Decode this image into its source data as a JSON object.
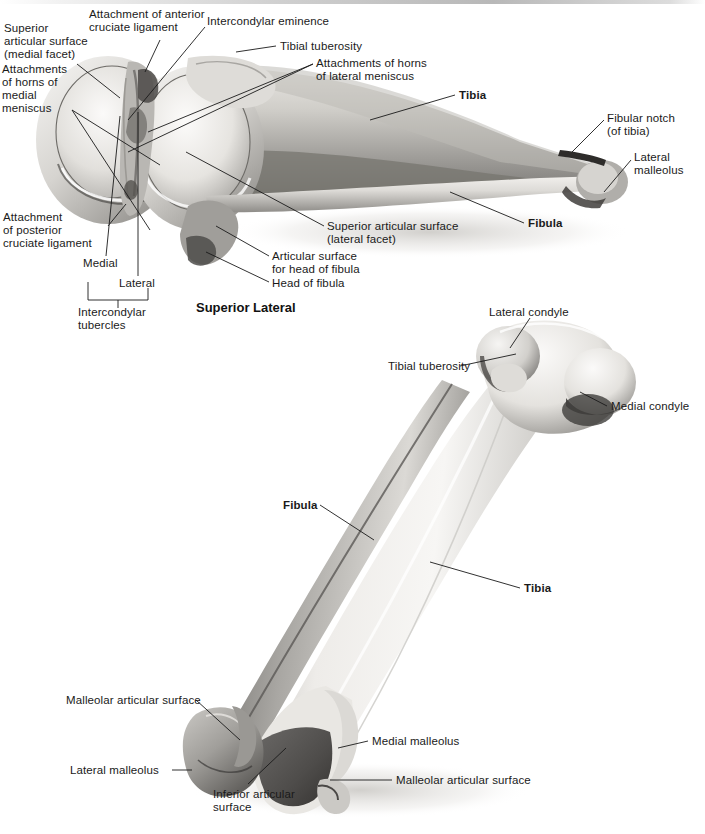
{
  "page": {
    "background_color": "#ffffff",
    "text_color": "#1a1a1a",
    "width": 705,
    "height": 834
  },
  "figures": [
    {
      "id": "figure-superior-lateral",
      "caption": "Superior Lateral",
      "labels": [
        {
          "id": "superior-articular-surface-medial-facet",
          "text": "Superior\narticular surface\n(medial facet)",
          "x": 4,
          "y": 27,
          "bold": false
        },
        {
          "id": "attachment-of-anterior-cruciate-ligament",
          "text": "Attachment of anterior\ncruciate ligament",
          "x": 89,
          "y": 10,
          "bold": false
        },
        {
          "id": "intercondylar-eminence",
          "text": "Intercondylar eminence",
          "x": 207,
          "y": 17,
          "bold": false
        },
        {
          "id": "attachments-of-horns-of-medial-meniscus",
          "text": "Attachments\nof horns of\nmedial\nmeniscus",
          "x": 2,
          "y": 68,
          "bold": false
        },
        {
          "id": "tibial-tuberosity-top",
          "text": "Tibial tuberosity",
          "x": 279,
          "y": 39,
          "bold": false
        },
        {
          "id": "attachments-of-horns-of-lateral-meniscus",
          "text": "Attachments of horns\nof lateral meniscus",
          "x": 315,
          "y": 57,
          "bold": false
        },
        {
          "id": "tibia-top",
          "text": "Tibia",
          "x": 459,
          "y": 88,
          "bold": true
        },
        {
          "id": "fibular-notch-of-tibia",
          "text": "Fibular notch\n(of tibia)",
          "x": 606,
          "y": 111,
          "bold": false
        },
        {
          "id": "lateral-malleolus-top",
          "text": "Lateral\nmalleolus",
          "x": 633,
          "y": 150,
          "bold": false
        },
        {
          "id": "fibula-top",
          "text": "Fibula",
          "x": 527,
          "y": 217,
          "bold": true
        },
        {
          "id": "superior-articular-surface-lateral-facet",
          "text": "Superior articular surface\n(lateral facet)",
          "x": 326,
          "y": 219,
          "bold": false
        },
        {
          "id": "articular-surface-for-head-of-fibula",
          "text": "Articular surface\nfor head of fibula",
          "x": 271,
          "y": 250,
          "bold": false
        },
        {
          "id": "head-of-fibula",
          "text": "Head of fibula",
          "x": 271,
          "y": 277,
          "bold": false
        },
        {
          "id": "attachment-of-posterior-cruciate-ligament",
          "text": "Attachment\nof posterior\ncruciate ligament",
          "x": 3,
          "y": 215,
          "bold": false
        },
        {
          "id": "medial-tubercle",
          "text": "Medial",
          "x": 83,
          "y": 262,
          "bold": false
        },
        {
          "id": "lateral-tubercle",
          "text": "Lateral",
          "x": 119,
          "y": 281,
          "bold": false
        },
        {
          "id": "intercondylar-tubercles",
          "text": "Intercondylar\ntubercles",
          "x": 78,
          "y": 304,
          "bold": false
        }
      ]
    },
    {
      "id": "figure-anterior",
      "caption": "",
      "labels": [
        {
          "id": "lateral-condyle",
          "text": "Lateral condyle",
          "x": 488,
          "y": 305,
          "bold": false
        },
        {
          "id": "tibial-tuberosity-bottom",
          "text": "Tibial tuberosity",
          "x": 388,
          "y": 360,
          "bold": false
        },
        {
          "id": "medial-condyle",
          "text": "Medial condyle",
          "x": 610,
          "y": 400,
          "bold": false
        },
        {
          "id": "fibula-bottom",
          "text": "Fibula",
          "x": 283,
          "y": 500,
          "bold": true
        },
        {
          "id": "tibia-bottom",
          "text": "Tibia",
          "x": 523,
          "y": 583,
          "bold": true
        },
        {
          "id": "malleolar-articular-surface-left",
          "text": "Malleolar articular surface",
          "x": 66,
          "y": 695,
          "bold": false
        },
        {
          "id": "lateral-malleolus-bottom",
          "text": "Lateral malleolus",
          "x": 70,
          "y": 765,
          "bold": false
        },
        {
          "id": "medial-malleolus",
          "text": "Medial malleolus",
          "x": 371,
          "y": 736,
          "bold": false
        },
        {
          "id": "malleolar-articular-surface-right",
          "text": "Malleolar articular surface",
          "x": 395,
          "y": 775,
          "bold": false
        },
        {
          "id": "inferior-articular-surface",
          "text": "Inferior articular\nsurface",
          "x": 213,
          "y": 788,
          "bold": false
        }
      ]
    }
  ],
  "colors": {
    "bone_light": "#f4f3f1",
    "bone_mid": "#cfcdc9",
    "bone_dark": "#8f8d89",
    "bone_shadow": "#4a4846",
    "leader_line": "#1a1a1a"
  }
}
